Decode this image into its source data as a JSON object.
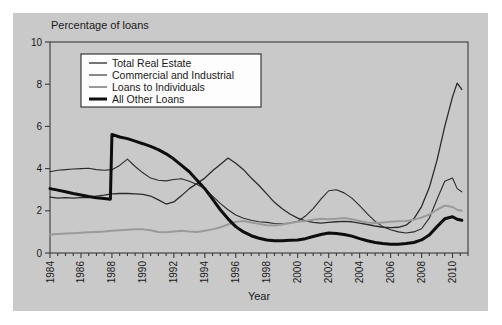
{
  "figure": {
    "background_color": "#c9c9c9",
    "page_background_color": "#ffffff",
    "frame_color": "#3a3a3a"
  },
  "chart_data": {
    "type": "line",
    "title": "",
    "ylabel_top": "Percentage of loans",
    "xlabel": "Year",
    "xlim": [
      1984,
      2011
    ],
    "ylim": [
      0,
      10
    ],
    "yticks": [
      0,
      2,
      4,
      6,
      8,
      10
    ],
    "ytick_labels": [
      "0",
      "2",
      "4",
      "6",
      "8",
      "10"
    ],
    "xticks": [
      1984,
      1986,
      1988,
      1990,
      1992,
      1994,
      1996,
      1998,
      2000,
      2002,
      2004,
      2006,
      2008,
      2010
    ],
    "xtick_labels": [
      "1984",
      "1986",
      "1988",
      "1990",
      "1992",
      "1994",
      "1996",
      "1998",
      "2000",
      "2002",
      "2004",
      "2006",
      "2008",
      "2010"
    ],
    "xtick_minor_step": 0.5,
    "grid": false,
    "legend_position": "upper-left-inside",
    "series": [
      {
        "name": "Total Real Estate",
        "color": "#2b2b2b",
        "width": 1.3,
        "x": [
          1984.0,
          1984.5,
          1985.0,
          1985.5,
          1986.0,
          1986.5,
          1987.0,
          1987.5,
          1988.0,
          1988.5,
          1989.0,
          1989.5,
          1990.0,
          1990.5,
          1991.0,
          1991.5,
          1992.0,
          1992.5,
          1993.0,
          1993.5,
          1994.0,
          1994.5,
          1995.0,
          1995.5,
          1996.0,
          1996.5,
          1997.0,
          1997.5,
          1998.0,
          1998.5,
          1999.0,
          1999.5,
          2000.0,
          2000.5,
          2001.0,
          2001.5,
          2002.0,
          2002.5,
          2003.0,
          2003.5,
          2004.0,
          2004.5,
          2005.0,
          2005.5,
          2006.0,
          2006.5,
          2007.0,
          2007.5,
          2008.0,
          2008.5,
          2009.0,
          2009.5,
          2010.0,
          2010.3,
          2010.6
        ],
        "y": [
          2.65,
          2.6,
          2.62,
          2.6,
          2.62,
          2.62,
          2.7,
          2.74,
          2.8,
          2.82,
          2.82,
          2.8,
          2.78,
          2.7,
          2.52,
          2.32,
          2.42,
          2.72,
          3.05,
          3.3,
          3.55,
          3.9,
          4.2,
          4.5,
          4.25,
          3.95,
          3.55,
          3.2,
          2.8,
          2.4,
          2.1,
          1.85,
          1.65,
          1.52,
          1.45,
          1.42,
          1.45,
          1.48,
          1.5,
          1.48,
          1.42,
          1.35,
          1.28,
          1.22,
          1.2,
          1.22,
          1.32,
          1.62,
          2.2,
          3.1,
          4.4,
          6.0,
          7.4,
          8.05,
          7.75
        ]
      },
      {
        "name": "Commercial and Industrial",
        "color": "#2b2b2b",
        "width": 1.1,
        "x": [
          1984.0,
          1984.5,
          1985.0,
          1985.5,
          1986.0,
          1986.5,
          1987.0,
          1987.5,
          1988.0,
          1988.5,
          1989.0,
          1989.5,
          1990.0,
          1990.5,
          1991.0,
          1991.5,
          1992.0,
          1992.5,
          1993.0,
          1993.5,
          1994.0,
          1994.5,
          1995.0,
          1995.5,
          1996.0,
          1996.5,
          1997.0,
          1997.5,
          1998.0,
          1998.5,
          1999.0,
          1999.5,
          2000.0,
          2000.5,
          2001.0,
          2001.5,
          2002.0,
          2002.5,
          2003.0,
          2003.5,
          2004.0,
          2004.5,
          2005.0,
          2005.5,
          2006.0,
          2006.5,
          2007.0,
          2007.5,
          2008.0,
          2008.5,
          2009.0,
          2009.5,
          2010.0,
          2010.3,
          2010.6
        ],
        "y": [
          3.85,
          3.92,
          3.95,
          3.98,
          4.0,
          4.02,
          3.95,
          3.92,
          3.95,
          4.15,
          4.45,
          4.1,
          3.8,
          3.55,
          3.45,
          3.42,
          3.48,
          3.52,
          3.4,
          3.25,
          3.05,
          2.7,
          2.35,
          2.05,
          1.8,
          1.65,
          1.55,
          1.48,
          1.45,
          1.4,
          1.38,
          1.42,
          1.5,
          1.75,
          2.1,
          2.55,
          2.95,
          3.0,
          2.85,
          2.6,
          2.25,
          1.85,
          1.5,
          1.25,
          1.1,
          1.0,
          0.95,
          1.0,
          1.15,
          1.65,
          2.55,
          3.4,
          3.55,
          3.05,
          2.9
        ]
      },
      {
        "name": "Loans to Individuals",
        "color": "#9a9a9a",
        "width": 2.0,
        "x": [
          1984.0,
          1984.5,
          1985.0,
          1985.5,
          1986.0,
          1986.5,
          1987.0,
          1987.5,
          1988.0,
          1988.5,
          1989.0,
          1989.5,
          1990.0,
          1990.5,
          1991.0,
          1991.5,
          1992.0,
          1992.5,
          1993.0,
          1993.5,
          1994.0,
          1994.5,
          1995.0,
          1995.5,
          1996.0,
          1996.5,
          1997.0,
          1997.5,
          1998.0,
          1998.5,
          1999.0,
          1999.5,
          2000.0,
          2000.5,
          2001.0,
          2001.5,
          2002.0,
          2002.5,
          2003.0,
          2003.5,
          2004.0,
          2004.5,
          2005.0,
          2005.5,
          2006.0,
          2006.5,
          2007.0,
          2007.5,
          2008.0,
          2008.5,
          2009.0,
          2009.5,
          2010.0,
          2010.3,
          2010.6
        ],
        "y": [
          0.88,
          0.9,
          0.92,
          0.94,
          0.96,
          0.98,
          1.0,
          1.02,
          1.05,
          1.08,
          1.1,
          1.12,
          1.12,
          1.08,
          1.0,
          0.98,
          1.02,
          1.05,
          1.02,
          1.0,
          1.05,
          1.12,
          1.22,
          1.35,
          1.48,
          1.52,
          1.45,
          1.38,
          1.32,
          1.3,
          1.35,
          1.42,
          1.48,
          1.52,
          1.58,
          1.62,
          1.6,
          1.62,
          1.66,
          1.6,
          1.52,
          1.45,
          1.42,
          1.45,
          1.48,
          1.5,
          1.52,
          1.58,
          1.68,
          1.82,
          2.05,
          2.25,
          2.18,
          2.05,
          2.0
        ]
      },
      {
        "name": "All Other Loans",
        "color": "#0d0d0d",
        "width": 3.0,
        "x": [
          1984.0,
          1984.5,
          1985.0,
          1985.5,
          1986.0,
          1986.5,
          1987.0,
          1987.5,
          1987.9,
          1988.0,
          1988.5,
          1989.0,
          1989.5,
          1990.0,
          1990.5,
          1991.0,
          1991.5,
          1992.0,
          1992.5,
          1993.0,
          1993.5,
          1994.0,
          1994.5,
          1995.0,
          1995.5,
          1996.0,
          1996.5,
          1997.0,
          1997.5,
          1998.0,
          1998.5,
          1999.0,
          1999.5,
          2000.0,
          2000.5,
          2001.0,
          2001.5,
          2002.0,
          2002.5,
          2003.0,
          2003.5,
          2004.0,
          2004.5,
          2005.0,
          2005.5,
          2006.0,
          2006.5,
          2007.0,
          2007.5,
          2008.0,
          2008.5,
          2009.0,
          2009.5,
          2010.0,
          2010.3,
          2010.6
        ],
        "y": [
          3.05,
          2.98,
          2.9,
          2.82,
          2.75,
          2.68,
          2.62,
          2.58,
          2.55,
          5.62,
          5.5,
          5.42,
          5.3,
          5.18,
          5.05,
          4.9,
          4.7,
          4.45,
          4.15,
          3.85,
          3.45,
          3.05,
          2.55,
          2.05,
          1.62,
          1.25,
          1.0,
          0.82,
          0.7,
          0.62,
          0.58,
          0.58,
          0.6,
          0.62,
          0.68,
          0.78,
          0.88,
          0.95,
          0.92,
          0.88,
          0.8,
          0.68,
          0.58,
          0.5,
          0.45,
          0.42,
          0.42,
          0.45,
          0.5,
          0.62,
          0.85,
          1.25,
          1.62,
          1.72,
          1.6,
          1.55
        ]
      }
    ]
  }
}
